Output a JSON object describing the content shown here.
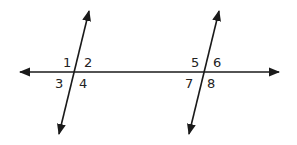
{
  "diagram": {
    "line_color": "#1a1a1a",
    "labels": {
      "a1": "1",
      "a2": "2",
      "a3": "3",
      "a4": "4",
      "a5": "5",
      "a6": "6",
      "a7": "7",
      "a8": "8"
    }
  }
}
